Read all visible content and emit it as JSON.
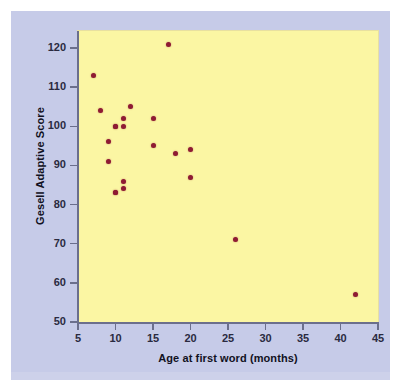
{
  "chart_data": {
    "type": "scatter",
    "title": "",
    "xlabel": "Age at first word (months)",
    "ylabel": "Gesell Adaptive Score",
    "xlim": [
      5,
      45
    ],
    "ylim": [
      48,
      124
    ],
    "xticks": [
      5,
      10,
      15,
      20,
      25,
      30,
      35,
      40,
      45
    ],
    "yticks": [
      50,
      60,
      70,
      80,
      90,
      100,
      110,
      120
    ],
    "grid": false,
    "legend": false,
    "legend_position": "none",
    "point_color": "#8e1b33",
    "plot_background": "#fbf6a3",
    "panel_background": "#c6cbe8",
    "axis_color": "#6b6f8c",
    "points": [
      {
        "x": 15,
        "y": 95
      },
      {
        "x": 26,
        "y": 71
      },
      {
        "x": 10,
        "y": 83
      },
      {
        "x": 9,
        "y": 91
      },
      {
        "x": 15,
        "y": 102
      },
      {
        "x": 20,
        "y": 87
      },
      {
        "x": 18,
        "y": 93
      },
      {
        "x": 11,
        "y": 100
      },
      {
        "x": 8,
        "y": 104
      },
      {
        "x": 20,
        "y": 94
      },
      {
        "x": 7,
        "y": 113
      },
      {
        "x": 9,
        "y": 96
      },
      {
        "x": 10,
        "y": 83
      },
      {
        "x": 11,
        "y": 84
      },
      {
        "x": 11,
        "y": 102
      },
      {
        "x": 10,
        "y": 100
      },
      {
        "x": 12,
        "y": 105
      },
      {
        "x": 42,
        "y": 57
      },
      {
        "x": 17,
        "y": 121
      },
      {
        "x": 11,
        "y": 86
      },
      {
        "x": 10,
        "y": 100
      }
    ]
  }
}
